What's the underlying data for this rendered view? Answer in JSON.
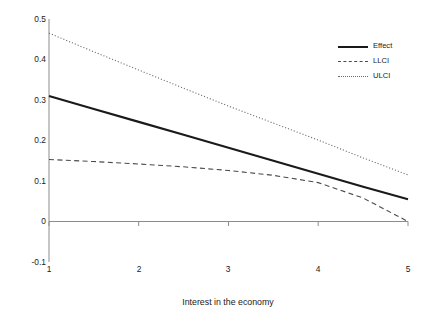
{
  "chart_data": {
    "type": "line",
    "title": "",
    "xlabel": "Interest in the economy",
    "ylabel": "Conditional effect of exposre to negative ecoomic news",
    "xlim": [
      1,
      5
    ],
    "ylim": [
      -0.1,
      0.5
    ],
    "xticks": [
      "1",
      "2",
      "3",
      "4",
      "5"
    ],
    "xtick_values": [
      1,
      2,
      3,
      4,
      5
    ],
    "yticks": [
      "0.5",
      "0.4",
      "0.3",
      "0.2",
      "0.1",
      "0",
      "-0.1"
    ],
    "ytick_values": [
      0.5,
      0.4,
      0.3,
      0.2,
      0.1,
      0,
      -0.1
    ],
    "grid": false,
    "legend_position": "top-right",
    "x": [
      1,
      1.5,
      2,
      2.5,
      3,
      3.5,
      4,
      4.5,
      5
    ],
    "series": [
      {
        "name": "Effect",
        "style": "solid",
        "color": "#1a1a1a",
        "values": [
          0.31,
          0.278,
          0.246,
          0.214,
          0.182,
          0.15,
          0.118,
          0.086,
          0.055
        ]
      },
      {
        "name": "LLCI",
        "style": "dashed",
        "color": "#4a4a4a",
        "values": [
          0.153,
          0.148,
          0.142,
          0.135,
          0.126,
          0.114,
          0.096,
          0.058,
          0.0
        ]
      },
      {
        "name": "ULCI",
        "style": "dotted",
        "color": "#6a6a6a",
        "values": [
          0.465,
          0.419,
          0.374,
          0.329,
          0.285,
          0.243,
          0.201,
          0.157,
          0.115
        ]
      }
    ]
  },
  "legend": {
    "items": [
      {
        "label": "Effect"
      },
      {
        "label": "LLCI"
      },
      {
        "label": "ULCI"
      }
    ]
  },
  "axis": {
    "zero_line_label": "0"
  }
}
